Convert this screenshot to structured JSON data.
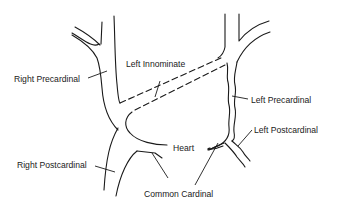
{
  "diagram": {
    "title": "",
    "labels": {
      "right_precardinal": "Right Precardinal",
      "left_innominate": "Left Innominate",
      "left_precardinal": "Left Precardinal",
      "left_postcardinal": "Left Postcardinal",
      "heart": "Heart",
      "right_postcardinal": "Right Postcardinal",
      "common_cardinal": "Common Cardinal"
    },
    "colors": {
      "line": "#1a1a1a",
      "background": "#ffffff"
    }
  }
}
